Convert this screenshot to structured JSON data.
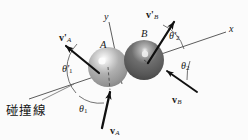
{
  "figure": {
    "title": "碰撞線",
    "width": 248,
    "height": 140,
    "background_color": "#fbfbfb",
    "line_color": "#4a4a4a",
    "arrow_color": "#101010",
    "text_color": "#1a1a1a"
  },
  "axes": {
    "x_label": "x",
    "y_label": "y",
    "collision_line_label": "碰撞線",
    "x_axis_angle_deg": -16,
    "y_axis_angle_deg": 74
  },
  "bodies": [
    {
      "id": "A",
      "label": "A",
      "color": "#9a9a9a",
      "highlight_color": "#f2f2f2",
      "cx": 108,
      "cy": 67,
      "r": 20
    },
    {
      "id": "B",
      "label": "B",
      "color": "#5c5c5c",
      "highlight_color": "#e8e8e8",
      "cx": 144,
      "cy": 60,
      "r": 20
    }
  ],
  "vectors": [
    {
      "name": "v_A",
      "symbol": "v",
      "prime": "",
      "subscript": "A",
      "label": "vA",
      "description": "incoming velocity of ball A",
      "tail": [
        102,
        128
      ],
      "tip": [
        110,
        90
      ]
    },
    {
      "name": "v_B",
      "symbol": "v",
      "prime": "",
      "subscript": "B",
      "label": "vB",
      "description": "incoming velocity of ball B",
      "tail": [
        197,
        92
      ],
      "tip": [
        165,
        70
      ]
    },
    {
      "name": "v_A_prime",
      "symbol": "v",
      "prime": "'",
      "subscript": "A",
      "label": "v'A",
      "description": "outgoing velocity of ball A",
      "tail": [
        99,
        73
      ],
      "tip": [
        64,
        45
      ]
    },
    {
      "name": "v_B_prime",
      "symbol": "v",
      "prime": "'",
      "subscript": "B",
      "label": "v'B",
      "description": "outgoing velocity of ball B",
      "tail": [
        148,
        63
      ],
      "tip": [
        175,
        20
      ]
    }
  ],
  "angles": [
    {
      "name": "theta_1",
      "symbol": "θ",
      "prime": "",
      "subscript": "1",
      "label": "θ1",
      "description": "incidence angle of ball A from the collision line"
    },
    {
      "name": "theta_1_prime",
      "symbol": "θ",
      "prime": "'",
      "subscript": "1",
      "label": "θ'1",
      "description": "rebound angle of ball A from the collision line"
    },
    {
      "name": "theta_2",
      "symbol": "θ",
      "prime": "",
      "subscript": "2",
      "label": "θ2",
      "description": "incidence angle of ball B from the collision line"
    },
    {
      "name": "theta_2_prime",
      "symbol": "θ",
      "prime": "'",
      "subscript": "2",
      "label": "θ'2",
      "description": "rebound angle of ball B from the collision line"
    }
  ]
}
